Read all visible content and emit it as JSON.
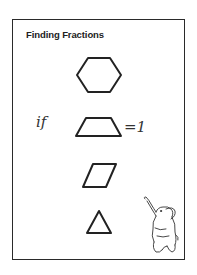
{
  "worksheet": {
    "title": "Finding Fractions",
    "handwritten_prefix": "if",
    "handwritten_suffix": "=1",
    "shapes": [
      {
        "name": "hexagon"
      },
      {
        "name": "trapezoid"
      },
      {
        "name": "rhombus"
      },
      {
        "name": "triangle"
      }
    ],
    "illustration": "elephant",
    "stroke_color": "#222222"
  }
}
